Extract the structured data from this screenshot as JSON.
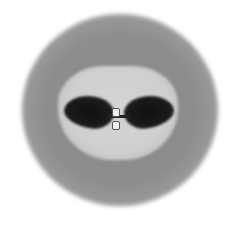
{
  "image": {
    "description": "Grayscale blurred rounded object with a lighter inner region containing two dark lobes joined at center by a small light connector",
    "colors": {
      "background": "#ffffff",
      "outer_ring": "#8d8d8d",
      "inner_region": "#cfcfcf",
      "lobes": "#1a1a1a",
      "connector": "#eeeeee"
    }
  }
}
